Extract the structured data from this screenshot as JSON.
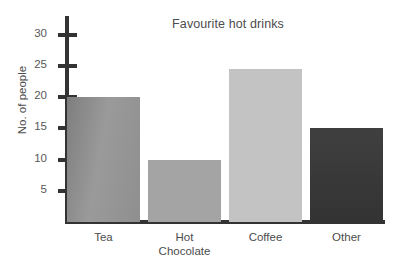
{
  "chart_data": {
    "type": "bar",
    "title": "Favourite hot drinks",
    "xlabel": "",
    "ylabel": "No. of people",
    "categories": [
      "Tea",
      "Hot\nChocolate",
      "Coffee",
      "Other"
    ],
    "values": [
      20,
      10,
      24.5,
      15
    ],
    "ylim": [
      0,
      33
    ],
    "yticks": [
      5,
      10,
      15,
      20,
      25,
      30
    ],
    "ytick_labels": [
      "5",
      "10",
      "15",
      "20",
      "25",
      "30"
    ],
    "grid": false,
    "legend": null,
    "bar_colors": [
      "#8a8a8a",
      "#a4a4a4",
      "#c3c3c3",
      "#3b3b3b"
    ],
    "axis_color": "#333333",
    "background": "#ffffff",
    "series": [
      {
        "name": "No. of people",
        "values": [
          20,
          10,
          24.5,
          15
        ]
      }
    ]
  }
}
